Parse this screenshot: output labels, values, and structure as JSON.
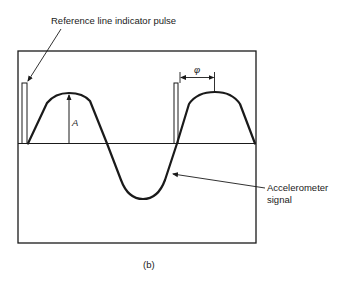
{
  "figure": {
    "caption": "(b)",
    "labels": {
      "reference_pulse": "Reference line indicator pulse",
      "amplitude": "A",
      "phase": "φ",
      "signal_line1": "Accelerometer",
      "signal_line2": "signal"
    },
    "colors": {
      "ink": "#1a1a1a",
      "background": "#ffffff"
    }
  }
}
